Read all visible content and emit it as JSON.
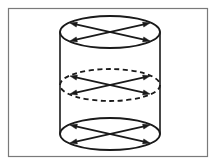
{
  "figure": {
    "background_color": "#ffffff",
    "stroke_color": "#1a1a1a",
    "frame_color": "#7a7a7a"
  },
  "frame": {
    "x": 8,
    "y": 8,
    "width": 199,
    "height": 148,
    "stroke_width": 1.2,
    "fill": "#ffffff"
  },
  "cylinder": {
    "center_x": 110,
    "left_wall_x": 60,
    "right_wall_x": 160,
    "radius_x": 50,
    "radius_y": 16,
    "top_center_y": 32,
    "bottom_center_y": 134,
    "wall_stroke_width": 1.6
  },
  "ellipses": [
    {
      "name": "top-rim-ellipse",
      "center_x": 110,
      "center_y": 32,
      "radius_x": 50,
      "radius_y": 16,
      "line_style": "solid",
      "stroke_width": 1.8,
      "dash_pattern": ""
    },
    {
      "name": "middle-cross-section-ellipse",
      "center_x": 110,
      "center_y": 85,
      "radius_x": 50,
      "radius_y": 16,
      "line_style": "dashed",
      "stroke_width": 1.8,
      "dash_pattern": "5,3.5"
    },
    {
      "name": "bottom-rim-ellipse",
      "center_x": 110,
      "center_y": 134,
      "radius_x": 50,
      "radius_y": 16,
      "line_style": "solid",
      "stroke_width": 1.8,
      "dash_pattern": ""
    }
  ],
  "chord_geometry": {
    "note": "Each ellipse carries two straight chords crossing near the ellipse centre, forming an X. Endpoints sit on the ellipse rim at roughly +/-40 px horizontally and +/-9 px vertically from the centre. Every endpoint is terminated by a solid arrowhead pointing outward.",
    "dx": 40,
    "dy": 9,
    "chords_per_ellipse": 2,
    "arrowheads_per_ellipse": 4,
    "chord_stroke_width": 1.7,
    "arrow_length": 7,
    "arrow_half_width": 2.6
  },
  "arrow_directions": [
    "up-left",
    "up-right",
    "down-left",
    "down-right"
  ]
}
